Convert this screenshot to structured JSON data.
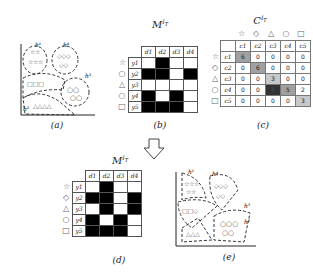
{
  "panels": {
    "a": {
      "caption": "(a)",
      "labels": [
        "h¹",
        "h⁴",
        "h³",
        "h²"
      ]
    },
    "b": {
      "caption": "(b)",
      "title": "M^{I_T}",
      "cols": [
        "d1",
        "d2",
        "d3",
        "d4"
      ],
      "rows": [
        "y1",
        "y2",
        "y3",
        "y4",
        "y5"
      ],
      "symbols": [
        "☆",
        "○",
        "△",
        "○",
        "□"
      ],
      "matrix": [
        [
          0,
          1,
          0,
          0
        ],
        [
          1,
          1,
          0,
          1
        ],
        [
          0,
          0,
          0,
          0
        ],
        [
          1,
          0,
          1,
          0
        ],
        [
          1,
          1,
          1,
          0
        ]
      ]
    },
    "c": {
      "caption": "(c)",
      "title": "C^{I_T}",
      "cols": [
        "c1",
        "c2",
        "c3",
        "c4",
        "c5"
      ],
      "rows": [
        "c1",
        "c2",
        "c3",
        "c4",
        "c5"
      ],
      "top_symbols": [
        "☆",
        "◇",
        "△",
        "○",
        "□"
      ],
      "side_symbols": [
        "☆",
        "◇",
        "△",
        "○",
        "□"
      ],
      "matrix": [
        [
          "6",
          "0",
          "0",
          "0",
          "0"
        ],
        [
          "0",
          "6",
          "0",
          "0",
          "0"
        ],
        [
          "0",
          "0",
          "3",
          "0",
          "0"
        ],
        [
          "0",
          "0",
          "7",
          "5",
          "2"
        ],
        [
          "0",
          "0",
          "0",
          "0",
          "3"
        ]
      ]
    },
    "d": {
      "caption": "(d)",
      "title": "M^{I_T}",
      "cols": [
        "d1",
        "d2",
        "d3",
        "d4"
      ],
      "rows": [
        "y1",
        "y2",
        "y3",
        "y4",
        "y5"
      ],
      "symbols": [
        "☆",
        "◇",
        "△",
        "○",
        "□"
      ],
      "matrix": [
        [
          0,
          1,
          0,
          0
        ],
        [
          1,
          1,
          0,
          1
        ],
        [
          0,
          1,
          0,
          1
        ],
        [
          1,
          0,
          1,
          0
        ],
        [
          1,
          1,
          1,
          0
        ]
      ]
    },
    "e": {
      "caption": "(e)",
      "labels": [
        "h¹",
        "h⁴",
        "h³",
        "h²"
      ]
    }
  },
  "colors": {
    "cell_dark": "#000000",
    "heat_light": "#c8c8c8",
    "heat_mid": "#a0a0a0",
    "heat_dark": "#333333"
  }
}
